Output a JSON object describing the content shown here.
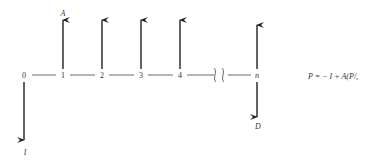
{
  "diagram": {
    "type": "cash-flow-diagram",
    "timeline": {
      "points": [
        {
          "label": "0",
          "x": 24
        },
        {
          "label": "1",
          "x": 63
        },
        {
          "label": "2",
          "x": 102
        },
        {
          "label": "3",
          "x": 141
        },
        {
          "label": "4",
          "x": 180
        },
        {
          "label": "n",
          "x": 257
        }
      ],
      "break_symbol": "axis-break"
    },
    "arrows": {
      "up_label": "A",
      "down_initial_label": "I",
      "down_final_label": "D"
    },
    "formula": "P = − I + A(P/,"
  }
}
